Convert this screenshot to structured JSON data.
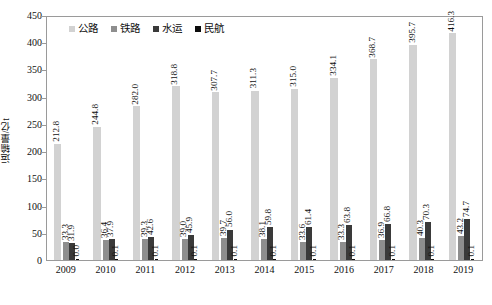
{
  "chart_data": {
    "type": "bar",
    "title": "",
    "xlabel": "",
    "ylabel": "运输量/亿t",
    "ylim": [
      0,
      450
    ],
    "ytick_step": 50,
    "yticks": [
      "450",
      "400",
      "350",
      "300",
      "250",
      "200",
      "150",
      "100",
      "50",
      "0"
    ],
    "grid": false,
    "legend_position": "top-left",
    "categories": [
      "2009",
      "2010",
      "2011",
      "2012",
      "2013",
      "2014",
      "2015",
      "2016",
      "2017",
      "2018",
      "2019"
    ],
    "series": [
      {
        "name": "公路",
        "color": "#d2d2d2",
        "values": [
          212.8,
          244.8,
          282.0,
          318.8,
          307.7,
          311.3,
          315.0,
          334.1,
          368.7,
          395.7,
          416.3
        ],
        "labels": [
          "212.8",
          "244.8",
          "282.0",
          "318.8",
          "307.7",
          "311.3",
          "315.0",
          "334.1",
          "368.7",
          "395.7",
          "416.3"
        ]
      },
      {
        "name": "铁路",
        "color": "#8e8e8e",
        "values": [
          33.3,
          36.4,
          39.3,
          39.0,
          39.7,
          38.1,
          33.6,
          33.3,
          36.9,
          40.3,
          43.2
        ],
        "labels": [
          "33.3",
          "36.4",
          "39.3",
          "39.0",
          "39.7",
          "38.1",
          "33.6",
          "33.3",
          "36.9",
          "40.3",
          "43.2"
        ]
      },
      {
        "name": "水运",
        "color": "#3a3a3a",
        "values": [
          31.9,
          37.9,
          42.6,
          45.9,
          56.0,
          59.8,
          61.4,
          63.8,
          66.8,
          70.3,
          74.7
        ],
        "labels": [
          "31.9",
          "37.9",
          "42.6",
          "45.9",
          "56.0",
          "59.8",
          "61.4",
          "63.8",
          "66.8",
          "70.3",
          "74.7"
        ]
      },
      {
        "name": "民航",
        "color": "#0c0c0c",
        "values": [
          0.0,
          0.1,
          0.1,
          0.1,
          0.1,
          0.1,
          0.1,
          0.1,
          0.1,
          0.1,
          0.1
        ],
        "labels": [
          "0.0",
          "0.1",
          "0.1",
          "0.1",
          "0.1",
          "0.1",
          "0.1",
          "0.1",
          "0.1",
          "0.1",
          "0.1"
        ]
      }
    ]
  },
  "legend": {
    "items": [
      {
        "label": "公路",
        "color": "#d2d2d2"
      },
      {
        "label": "铁路",
        "color": "#8e8e8e"
      },
      {
        "label": "水运",
        "color": "#3a3a3a"
      },
      {
        "label": "民航",
        "color": "#0c0c0c"
      }
    ]
  },
  "axes": {
    "y_title": "运输量/亿t"
  }
}
